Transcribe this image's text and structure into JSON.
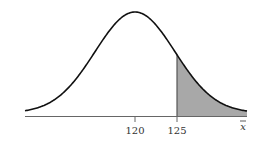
{
  "chart_data": {
    "type": "area",
    "title": "",
    "xlabel": "x̄",
    "ylabel": "",
    "mean": 120,
    "tick_labels": [
      "120",
      "125"
    ],
    "shaded_region": {
      "from": 125,
      "to": "right tail"
    },
    "colors": {
      "curve": "#111111",
      "shade": "#a8a8a8",
      "axis": "#555555"
    }
  },
  "axis": {
    "tick_1": "120",
    "tick_2": "125",
    "x_label": "x"
  }
}
